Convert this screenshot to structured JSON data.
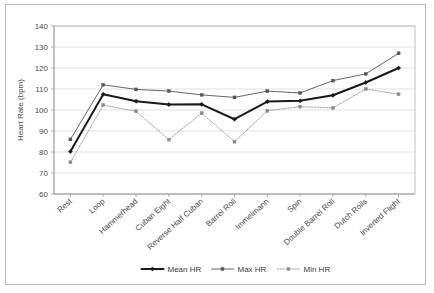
{
  "chart_data": {
    "type": "line",
    "title": "",
    "xlabel": "",
    "ylabel": "Heart Rate (bpm)",
    "ylim": [
      60,
      140
    ],
    "ytick_step": 10,
    "yticks": [
      60,
      70,
      80,
      90,
      100,
      110,
      120,
      130,
      140
    ],
    "grid": true,
    "legend_position": "bottom",
    "categories": [
      "Rest",
      "Loop",
      "Hammerhead",
      "Cuban Eight",
      "Reverse Half Cuban",
      "Barrel Roll",
      "Immelmann",
      "Spin",
      "Double Barrel Roll",
      "Dutch Rolls",
      "Inverted Flight"
    ],
    "series": [
      {
        "name": "Mean HR",
        "color": "#1a1a1a",
        "style": "solid-thick",
        "marker": "diamond",
        "values": [
          80.2,
          107.5,
          104.2,
          102.6,
          102.7,
          95.6,
          104.0,
          104.4,
          107.0,
          113.1,
          120.0
        ]
      },
      {
        "name": "Max HR",
        "color": "#555555",
        "style": "solid-thin",
        "marker": "square",
        "values": [
          86.0,
          112.0,
          109.8,
          109.0,
          107.2,
          106.0,
          109.0,
          108.1,
          114.0,
          117.2,
          127.0
        ]
      },
      {
        "name": "Min HR",
        "color": "#8a8a8a",
        "style": "dotted-thin",
        "marker": "square",
        "values": [
          75.1,
          102.4,
          99.4,
          85.9,
          98.5,
          84.9,
          99.6,
          101.6,
          101.0,
          110.0,
          107.5
        ]
      }
    ]
  },
  "legend": {
    "items": [
      {
        "label": "Mean HR"
      },
      {
        "label": "Max HR"
      },
      {
        "label": "Min HR"
      }
    ]
  },
  "axis": {
    "y_title": "Heart Rate (bpm)"
  },
  "colors": {
    "frame_border": "#b9b9b9",
    "gridline": "#d2d2d2",
    "axis": "#9a9a9a",
    "text": "#4a4a4a",
    "mean_series": "#1a1a1a",
    "max_series": "#555555",
    "min_series": "#8a8a8a",
    "background": "#ffffff"
  }
}
